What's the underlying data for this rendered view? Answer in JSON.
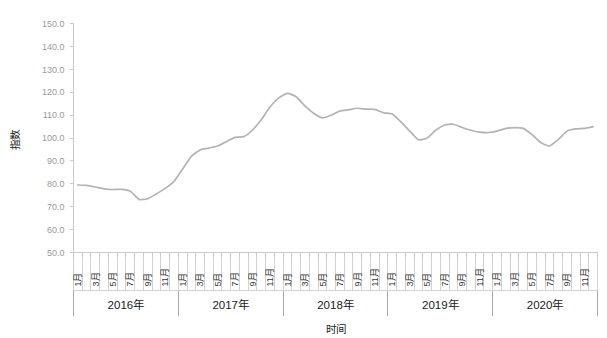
{
  "chart_data": {
    "type": "line",
    "title": "",
    "xlabel": "时间",
    "ylabel": "指数",
    "ylim": [
      50.0,
      150.0
    ],
    "ytick_step": 10.0,
    "grid": false,
    "legend": false,
    "legend_position": "none",
    "line_color": "#b3b3b3",
    "axis_color": "#c9c9c9",
    "ytick_labels": [
      "150.0",
      "140.0",
      "130.0",
      "120.0",
      "110.0",
      "100.0",
      "90.0",
      "80.0",
      "70.0",
      "60.0",
      "50.0"
    ],
    "ytick_values": [
      150.0,
      140.0,
      130.0,
      120.0,
      110.0,
      100.0,
      90.0,
      80.0,
      70.0,
      60.0,
      50.0
    ],
    "month_tick_labels": [
      "1月",
      "3月",
      "5月",
      "7月",
      "9月",
      "11月"
    ],
    "categories": [
      "2016-1",
      "2016-2",
      "2016-3",
      "2016-4",
      "2016-5",
      "2016-6",
      "2016-7",
      "2016-8",
      "2016-9",
      "2016-10",
      "2016-11",
      "2016-12",
      "2017-1",
      "2017-2",
      "2017-3",
      "2017-4",
      "2017-5",
      "2017-6",
      "2017-7",
      "2017-8",
      "2017-9",
      "2017-10",
      "2017-11",
      "2017-12",
      "2018-1",
      "2018-2",
      "2018-3",
      "2018-4",
      "2018-5",
      "2018-6",
      "2018-7",
      "2018-8",
      "2018-9",
      "2018-10",
      "2018-11",
      "2018-12",
      "2019-1",
      "2019-2",
      "2019-3",
      "2019-4",
      "2019-5",
      "2019-6",
      "2019-7",
      "2019-8",
      "2019-9",
      "2019-10",
      "2019-11",
      "2019-12",
      "2020-1",
      "2020-2",
      "2020-3",
      "2020-4",
      "2020-5",
      "2020-6",
      "2020-7",
      "2020-8",
      "2020-9",
      "2020-10",
      "2020-11",
      "2020-12"
    ],
    "values": [
      79.5,
      79.3,
      78.6,
      77.8,
      77.5,
      77.6,
      76.8,
      73.2,
      73.5,
      75.6,
      78.0,
      81.0,
      86.5,
      92.0,
      94.8,
      95.6,
      96.5,
      98.4,
      100.3,
      100.6,
      103.5,
      108.0,
      113.5,
      117.5,
      119.5,
      118.0,
      114.0,
      110.8,
      108.8,
      110.0,
      111.8,
      112.3,
      113.0,
      112.6,
      112.5,
      111.0,
      110.5,
      107.0,
      103.0,
      99.2,
      100.0,
      103.5,
      105.7,
      106.0,
      104.6,
      103.4,
      102.6,
      102.4,
      103.0,
      104.2,
      104.5,
      104.2,
      101.5,
      98.0,
      96.5,
      99.3,
      103.0,
      104.0,
      104.2,
      105.0
    ],
    "years": [
      {
        "label": "2016年",
        "start_index": 0,
        "end_index": 11
      },
      {
        "label": "2017年",
        "start_index": 12,
        "end_index": 23
      },
      {
        "label": "2018年",
        "start_index": 24,
        "end_index": 35
      },
      {
        "label": "2019年",
        "start_index": 36,
        "end_index": 47
      },
      {
        "label": "2020年",
        "start_index": 48,
        "end_index": 59
      }
    ]
  }
}
